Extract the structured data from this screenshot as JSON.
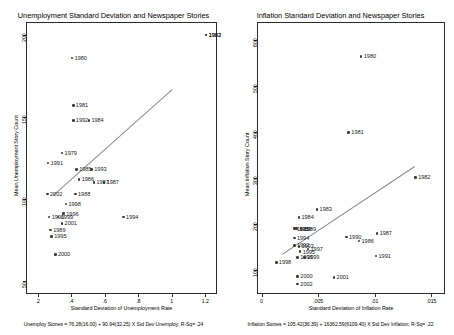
{
  "figure": {
    "width": 454,
    "height": 335,
    "panel_count": 2
  },
  "chart_data": [
    {
      "type": "scatter",
      "id": "unemployment-panel",
      "title": "Unemployment Standard Deviation and Newspaper Stories",
      "xlabel": "Standard Deviation of Unemployment Rate",
      "ylabel": "Mean Unemployment Story Count",
      "xlim": [
        0.13,
        1.27
      ],
      "ylim": [
        42,
        208
      ],
      "xticks": [
        0.2,
        0.4,
        0.6,
        0.8,
        1.0,
        1.2
      ],
      "xtick_labels": [
        ".2",
        ".4",
        ".6",
        ".8",
        "1",
        "1.2"
      ],
      "yticks": [
        50,
        100,
        150,
        200
      ],
      "ytick_labels": [
        "50",
        "100",
        "150",
        "200"
      ],
      "grid": false,
      "legend": "none",
      "caption": "Unemploy Stories = 76.28(16.00) + 90.94(32.25) X Std Dev Unemploy; R-Sq= .24",
      "fit_line": {
        "intercept": 76.28,
        "slope": 90.94,
        "x_start": 0.29,
        "x_end": 1.0
      },
      "points": [
        {
          "label": "1979",
          "x": 0.345,
          "y": 128
        },
        {
          "label": "1980",
          "x": 0.405,
          "y": 186
        },
        {
          "label": "1981",
          "x": 0.412,
          "y": 157
        },
        {
          "label": "1982",
          "x": 1.205,
          "y": 200
        },
        {
          "label": "1983",
          "x": 1.205,
          "y": 200
        },
        {
          "label": "1984",
          "x": 0.505,
          "y": 148
        },
        {
          "label": "1985",
          "x": 0.432,
          "y": 118
        },
        {
          "label": "1986",
          "x": 0.447,
          "y": 112
        },
        {
          "label": "1987",
          "x": 0.596,
          "y": 110
        },
        {
          "label": "1988",
          "x": 0.425,
          "y": 103
        },
        {
          "label": "1989",
          "x": 0.277,
          "y": 81
        },
        {
          "label": "1990",
          "x": 0.268,
          "y": 89
        },
        {
          "label": "1991",
          "x": 0.262,
          "y": 122
        },
        {
          "label": "1992",
          "x": 0.412,
          "y": 148
        },
        {
          "label": "1993",
          "x": 0.522,
          "y": 118
        },
        {
          "label": "1994",
          "x": 0.712,
          "y": 89
        },
        {
          "label": "1995",
          "x": 0.283,
          "y": 77
        },
        {
          "label": "1996",
          "x": 0.355,
          "y": 91
        },
        {
          "label": "1997",
          "x": 0.535,
          "y": 110
        },
        {
          "label": "1998",
          "x": 0.368,
          "y": 97
        },
        {
          "label": "1999",
          "x": 0.322,
          "y": 89
        },
        {
          "label": "2000",
          "x": 0.305,
          "y": 66
        },
        {
          "label": "2001",
          "x": 0.345,
          "y": 85
        },
        {
          "label": "2002",
          "x": 0.258,
          "y": 103
        }
      ]
    },
    {
      "type": "scatter",
      "id": "inflation-panel",
      "title": "Inflation Standard Deviation and Newspaper Stories",
      "xlabel": "Standard Deviation of Inflation Rate",
      "ylabel": "Mean Inflation Story Count",
      "xlim": [
        -0.0004,
        0.0162
      ],
      "ylim": [
        48,
        640
      ],
      "xticks": [
        0,
        0.005,
        0.01,
        0.015
      ],
      "xtick_labels": [
        "0",
        ".005",
        ".01",
        ".015"
      ],
      "yticks": [
        100,
        200,
        300,
        400,
        500,
        600
      ],
      "ytick_labels": [
        "100",
        "200",
        "300",
        "400",
        "500",
        "600"
      ],
      "grid": false,
      "legend": "none",
      "caption": "Inflation Stories = 105.42(36.39) + 16362.59(6109.40) X Std Dev Inflation; R-Sq= .22",
      "fit_line": {
        "intercept": 105.42,
        "slope": 16362.59,
        "x_start": 0.0018,
        "x_end": 0.0135
      },
      "points": [
        {
          "label": "1980",
          "x": 0.0088,
          "y": 565
        },
        {
          "label": "1981",
          "x": 0.0077,
          "y": 400
        },
        {
          "label": "1982",
          "x": 0.0136,
          "y": 302
        },
        {
          "label": "1983",
          "x": 0.0049,
          "y": 232
        },
        {
          "label": "1984",
          "x": 0.0033,
          "y": 215
        },
        {
          "label": "1985",
          "x": 0.0029,
          "y": 190
        },
        {
          "label": "1986",
          "x": 0.0086,
          "y": 163
        },
        {
          "label": "1987",
          "x": 0.0102,
          "y": 180
        },
        {
          "label": "1988",
          "x": 0.0031,
          "y": 190
        },
        {
          "label": "1989",
          "x": 0.0035,
          "y": 190
        },
        {
          "label": "1990",
          "x": 0.0075,
          "y": 172
        },
        {
          "label": "1991",
          "x": 0.0101,
          "y": 131
        },
        {
          "label": "1992",
          "x": 0.0029,
          "y": 154
        },
        {
          "label": "1993",
          "x": 0.0033,
          "y": 152
        },
        {
          "label": "1994",
          "x": 0.0029,
          "y": 170
        },
        {
          "label": "1995",
          "x": 0.0034,
          "y": 140
        },
        {
          "label": "1996",
          "x": 0.0032,
          "y": 128
        },
        {
          "label": "1997",
          "x": 0.0041,
          "y": 146
        },
        {
          "label": "1998",
          "x": 0.0013,
          "y": 117
        },
        {
          "label": "1999",
          "x": 0.0038,
          "y": 128
        },
        {
          "label": "2000",
          "x": 0.0032,
          "y": 86
        },
        {
          "label": "2001",
          "x": 0.0064,
          "y": 84
        },
        {
          "label": "2002",
          "x": 0.0032,
          "y": 70
        }
      ]
    }
  ]
}
